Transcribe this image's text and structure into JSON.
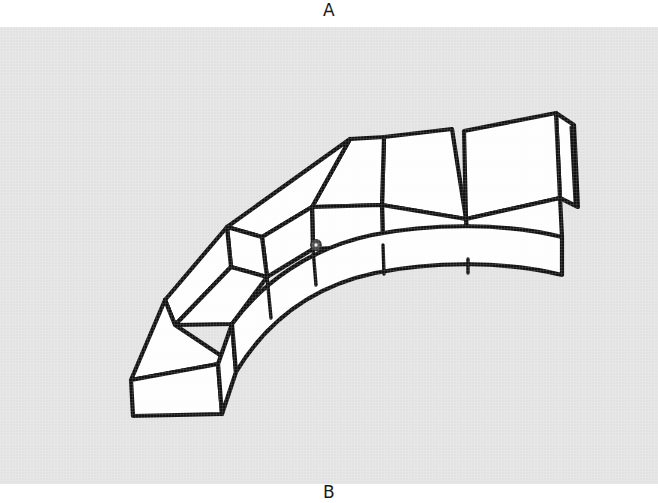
{
  "figure": {
    "top_label": "A",
    "bottom_label": "B",
    "title": "",
    "background_color": "#e4e4e4",
    "page_color": "#ffffff",
    "ink_color": "#111111",
    "face_fill_color": "#ffffff",
    "mark_color": "#555555",
    "drawing_style": "black-ink-line-drawing",
    "perspective": "three-quarter-isometric",
    "segment_count": 6,
    "segments": [
      {
        "name": "voussoir-1",
        "position": "lower-left-end"
      },
      {
        "name": "voussoir-2",
        "position": "left-lower"
      },
      {
        "name": "voussoir-3",
        "position": "left-upper"
      },
      {
        "name": "voussoir-4",
        "position": "crown-left"
      },
      {
        "name": "voussoir-5",
        "position": "crown-right"
      },
      {
        "name": "voussoir-6",
        "position": "right-end"
      }
    ],
    "annotations": [
      {
        "name": "dark-spot-mark",
        "x": 316,
        "y": 218,
        "radius": 5
      }
    ]
  }
}
